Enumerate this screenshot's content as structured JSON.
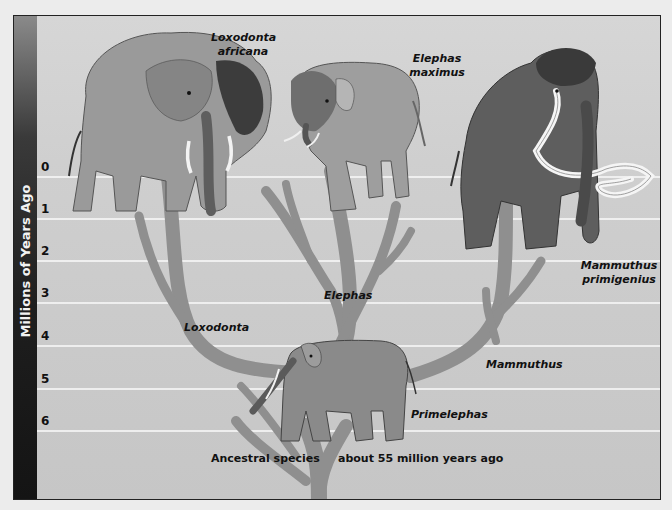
{
  "axis": {
    "title": "Millions of Years Ago",
    "ticks": [
      "0",
      "1",
      "2",
      "3",
      "4",
      "5",
      "6"
    ]
  },
  "species": {
    "loxodonta_africana": {
      "line1": "Loxodonta",
      "line2": "africana"
    },
    "elephas_maximus": {
      "line1": "Elephas",
      "line2": "maximus"
    },
    "mammuthus_primigenius": {
      "line1": "Mammuthus",
      "line2": "primigenius"
    }
  },
  "genera": {
    "loxodonta": "Loxodonta",
    "elephas": "Elephas",
    "mammuthus": "Mammuthus",
    "primelephas": "Primelephas"
  },
  "footer": {
    "ancestral": "Ancestral species",
    "age": "about 55 million years ago"
  },
  "colors": {
    "background": "#d0d0d0",
    "branch": "#8f8f8f",
    "gridline": "#f4f4f4",
    "sidebar": "#1e1e1e"
  }
}
